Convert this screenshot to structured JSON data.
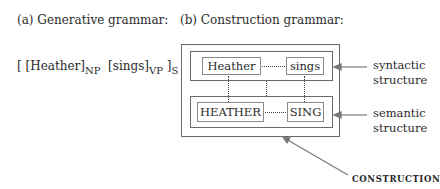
{
  "panel_a": {
    "heading": "(a) Generative grammar:",
    "formula": {
      "open_outer": "[ ",
      "np_word": "[Heather]",
      "np_sub": "NP",
      "vp_word": "[sings]",
      "vp_sub": "VP",
      "close_outer": " ]",
      "s_sub": "S"
    }
  },
  "panel_b": {
    "heading": "(b) Construction grammar:",
    "syntactic_words": [
      "Heather",
      "sings"
    ],
    "semantic_words": [
      "HEATHER",
      "SING"
    ],
    "labels": {
      "syntactic": [
        "syntactic",
        "structure"
      ],
      "semantic": [
        "semantic",
        "structure"
      ],
      "construction": "CONSTRUCTION"
    }
  }
}
